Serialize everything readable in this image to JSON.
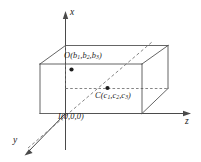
{
  "figure": {
    "background_color": "#ffffff",
    "line_color": "#545454",
    "axis_color": "#4a4a4a",
    "dash_color": "#6e6e6e",
    "point_color": "#1d1d1d"
  },
  "axes": {
    "x": {
      "label": "x",
      "direction": "up"
    },
    "y": {
      "label": "y",
      "direction": "down-left"
    },
    "z": {
      "label": "z",
      "direction": "right"
    }
  },
  "points": {
    "origin": {
      "name": "I",
      "open_paren": "(",
      "coords": [
        "0",
        "0",
        "0"
      ],
      "close_paren": ")",
      "separator": ","
    },
    "upper": {
      "name": "O",
      "open_paren": "(",
      "coord_letters": [
        "b",
        "b",
        "b"
      ],
      "coord_subscripts": [
        "1",
        "2",
        "3"
      ],
      "close_paren": ")",
      "separator": ","
    },
    "inner": {
      "name": "C",
      "open_paren": "(",
      "coord_letters": [
        "c",
        "c",
        "c"
      ],
      "coord_subscripts": [
        "1",
        "2",
        "3"
      ],
      "close_paren": ")",
      "separator": ","
    }
  }
}
